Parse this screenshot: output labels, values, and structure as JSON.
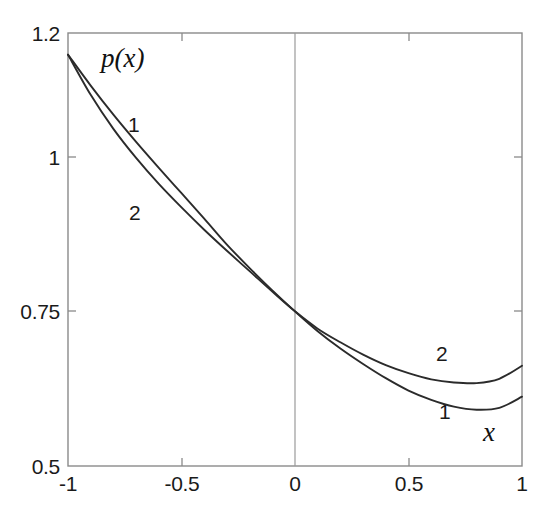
{
  "figure": {
    "width": 545,
    "height": 518,
    "background": "#ffffff",
    "line_color": "#2b2b2b",
    "axis_color": "#7a7a7a"
  },
  "axes": {
    "x_label": "x",
    "y_label": "p(x)",
    "x_tick_labels": [
      "-1",
      "-0.5",
      "0",
      "0.5",
      "1"
    ],
    "y_tick_labels": [
      "1.2",
      "1",
      "0.75",
      "0.5"
    ]
  },
  "curve_labels": {
    "left_upper": "1",
    "left_lower": "2",
    "right_upper": "2",
    "right_lower": "1"
  },
  "chart_data": {
    "type": "line",
    "title": "",
    "xlabel": "x",
    "ylabel": "p(x)",
    "xlim": [
      -1,
      1
    ],
    "ylim": [
      0.5,
      1.2
    ],
    "xticks": [
      -1,
      -0.5,
      0,
      0.5,
      1
    ],
    "yticks": [
      1.2,
      1,
      0.75,
      0.5
    ],
    "grid": false,
    "legend": "inline-curve-labels",
    "annotations": [
      {
        "text": "1",
        "x": -0.71,
        "y": 1.05
      },
      {
        "text": "2",
        "x": -0.705,
        "y": 0.908
      },
      {
        "text": "2",
        "x": 0.63,
        "y": 0.685
      },
      {
        "text": "1",
        "x": 0.645,
        "y": 0.592
      },
      {
        "text": "p(x)",
        "x": -0.82,
        "y": 1.145
      },
      {
        "text": "x",
        "x": 0.855,
        "y": 0.555
      }
    ],
    "x": [
      -1,
      -0.9,
      -0.8,
      -0.7,
      -0.6,
      -0.5,
      -0.4,
      -0.3,
      -0.2,
      -0.1,
      0,
      0.1,
      0.2,
      0.3,
      0.4,
      0.5,
      0.6,
      0.7,
      0.8,
      0.9,
      1
    ],
    "series": [
      {
        "name": "1",
        "values": [
          1.165,
          1.115,
          1.068,
          1.024,
          0.982,
          0.941,
          0.9,
          0.858,
          0.82,
          0.784,
          0.75,
          0.718,
          0.69,
          0.665,
          0.642,
          0.622,
          0.607,
          0.596,
          0.591,
          0.594,
          0.612
        ]
      },
      {
        "name": "2",
        "values": [
          1.165,
          1.1,
          1.045,
          0.998,
          0.956,
          0.918,
          0.882,
          0.848,
          0.815,
          0.782,
          0.75,
          0.722,
          0.7,
          0.68,
          0.663,
          0.65,
          0.64,
          0.635,
          0.634,
          0.641,
          0.662
        ]
      }
    ]
  }
}
